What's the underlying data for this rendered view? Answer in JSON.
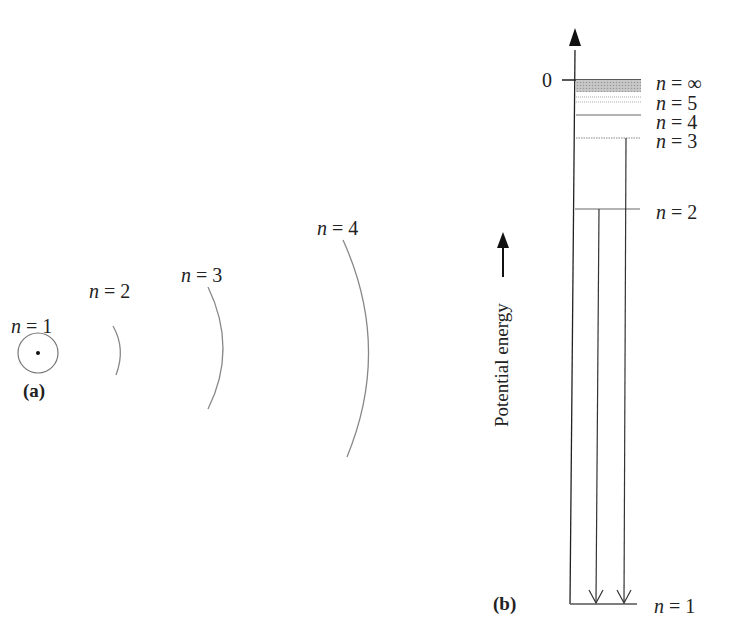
{
  "figure": {
    "panel_a": {
      "label": "(a)",
      "orbits": [
        {
          "n_var": "n",
          "eq": " = ",
          "value": "1"
        },
        {
          "n_var": "n",
          "eq": " = ",
          "value": "2"
        },
        {
          "n_var": "n",
          "eq": " = ",
          "value": "3"
        },
        {
          "n_var": "n",
          "eq": " = ",
          "value": "4"
        }
      ]
    },
    "panel_b": {
      "label": "(b)",
      "axis_label": "Potential energy",
      "zero_label": "0",
      "levels": [
        {
          "n_var": "n",
          "eq": " = ",
          "value": "∞"
        },
        {
          "n_var": "n",
          "eq": " = ",
          "value": "5"
        },
        {
          "n_var": "n",
          "eq": " = ",
          "value": "4"
        },
        {
          "n_var": "n",
          "eq": " = ",
          "value": "3"
        },
        {
          "n_var": "n",
          "eq": " = ",
          "value": "2"
        },
        {
          "n_var": "n",
          "eq": " = ",
          "value": "1"
        }
      ]
    },
    "colors": {
      "line": "#222222",
      "orbit": "#888888",
      "level_gray": "#999999",
      "shade": "#b8b8b8"
    }
  }
}
